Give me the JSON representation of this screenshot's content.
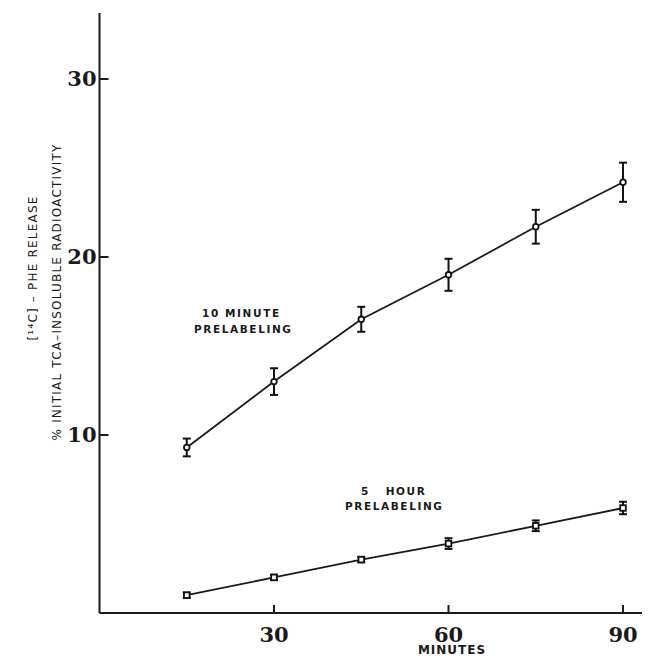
{
  "chart_data": {
    "type": "line",
    "title": "",
    "xlabel": "MINUTES",
    "ylabel_lines": [
      "[¹⁴C] – PHE RELEASE",
      "% INITIAL  TCA–INSOLUBLE  RADIOACTIVITY"
    ],
    "xlim": [
      0,
      95
    ],
    "ylim": [
      0,
      33.7
    ],
    "x_ticks": [
      30,
      60,
      90
    ],
    "x_tick_labels": [
      "30",
      "60",
      "90"
    ],
    "y_ticks": [
      10,
      20,
      30
    ],
    "y_tick_labels": [
      "10",
      "20",
      "30"
    ],
    "grid": false,
    "legend": "none (inline annotations)",
    "x": [
      15,
      30,
      45,
      60,
      75,
      90
    ],
    "series": [
      {
        "name": "10 minute prelabeling",
        "annotation": [
          "10 MINUTE",
          "PRELABELING"
        ],
        "marker": "circle",
        "values": [
          9.3,
          13.0,
          16.5,
          19.0,
          21.7,
          24.2
        ],
        "errors": [
          0.5,
          0.75,
          0.7,
          0.9,
          0.95,
          1.1
        ]
      },
      {
        "name": "5 hour prelabeling",
        "annotation": [
          "5   HOUR",
          "PRELABELING"
        ],
        "marker": "square",
        "values": [
          1.0,
          2.0,
          3.0,
          3.9,
          4.9,
          5.9
        ],
        "errors": [
          0.15,
          0.15,
          0.15,
          0.3,
          0.3,
          0.35
        ]
      }
    ]
  }
}
